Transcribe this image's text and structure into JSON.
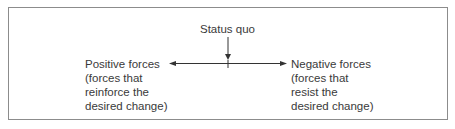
{
  "diagram": {
    "type": "force-field",
    "center": {
      "label": "Status quo"
    },
    "left": {
      "lines": [
        "Positive forces",
        "(forces that",
        "reinforce the",
        "desired change)"
      ],
      "direction": "left"
    },
    "right": {
      "lines": [
        "Negative forces",
        "(forces that",
        "resist the",
        "desired change)"
      ],
      "direction": "right"
    },
    "colors": {
      "text": "#3a3a3a",
      "line": "#333333",
      "border": "#8c8c8c"
    }
  }
}
